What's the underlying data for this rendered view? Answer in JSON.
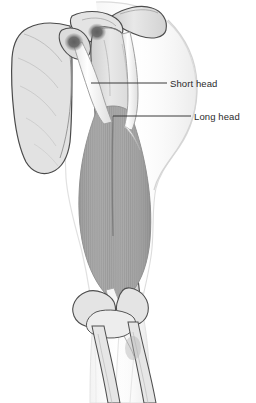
{
  "figure": {
    "width": 256,
    "height": 403,
    "background": "#ffffff"
  },
  "labels": [
    {
      "id": "short-head",
      "text": "Short head",
      "text_x": 170,
      "text_y": 79,
      "leader": {
        "x1": 91,
        "y1": 83,
        "x2": 167,
        "y2": 83
      }
    },
    {
      "id": "long-head",
      "text": "Long head",
      "text_x": 194,
      "text_y": 112,
      "leader": {
        "x1": 113,
        "y1": 116,
        "x2": 191,
        "y2": 116
      }
    }
  ],
  "colors": {
    "text": "#2b2b2b",
    "leader_line": "#3a3a3a",
    "bone_fill": "#e2e2e2",
    "bone_fill_light": "#ececec",
    "bone_outline": "#4a4a4a",
    "muscle_fill": "#a9a9a9",
    "muscle_fill_dark": "#9a9a9a",
    "muscle_striation": "#8e8e8e",
    "tendon_fill": "#fbfbfb",
    "tendon_outline": "#9b9b9b",
    "attachment_dark": "#6a6a6a",
    "skin_outline": "#d8d8d8",
    "skin_shadow": "#eeeeee"
  },
  "structures": [
    {
      "name": "skin-outline",
      "label": "arm and shoulder surface contour"
    },
    {
      "name": "clavicle",
      "label": "clavicle"
    },
    {
      "name": "acromion",
      "label": "acromion process"
    },
    {
      "name": "scapula",
      "label": "scapula body"
    },
    {
      "name": "coracoid-process",
      "label": "coracoid process"
    },
    {
      "name": "humerus",
      "label": "humerus shaft"
    },
    {
      "name": "humeral-head",
      "label": "head of humerus"
    },
    {
      "name": "short-head-origin",
      "label": "short head origin at coracoid process"
    },
    {
      "name": "long-head-origin",
      "label": "long head origin at supraglenoid tubercle"
    },
    {
      "name": "short-head-tendon",
      "label": "short head tendon"
    },
    {
      "name": "long-head-tendon",
      "label": "long head tendon"
    },
    {
      "name": "muscle-belly",
      "label": "biceps brachii muscle belly"
    },
    {
      "name": "distal-tendon",
      "label": "distal biceps tendon"
    },
    {
      "name": "humeral-condyles",
      "label": "distal humerus condyles"
    },
    {
      "name": "radius",
      "label": "radius"
    },
    {
      "name": "ulna",
      "label": "ulna"
    }
  ]
}
